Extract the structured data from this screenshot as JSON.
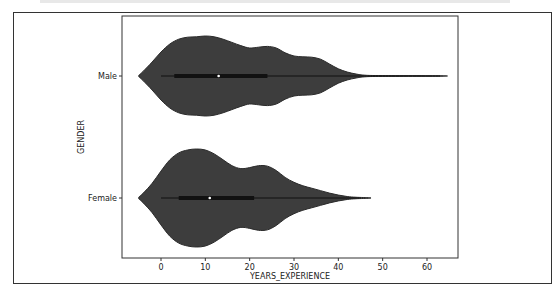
{
  "chart_data": {
    "type": "violin",
    "orientation": "horizontal",
    "title": "",
    "xlabel": "YEARS_EXPERIENCE",
    "ylabel": "GENDER",
    "xlim": [
      -6,
      70
    ],
    "xticks": [
      0,
      10,
      20,
      30,
      40,
      50,
      60
    ],
    "categories": [
      "Male",
      "Female"
    ],
    "fill_color": "#3d3d3d",
    "edge_color": "#2a2a2a",
    "series": [
      {
        "name": "Male",
        "min": 0,
        "q1": 3,
        "median": 13,
        "q3": 24,
        "max": 63,
        "density": [
          [
            -5,
            0.02
          ],
          [
            -4,
            0.12
          ],
          [
            -2,
            0.35
          ],
          [
            0,
            0.6
          ],
          [
            2,
            0.8
          ],
          [
            4,
            0.92
          ],
          [
            6,
            0.97
          ],
          [
            8,
            0.98
          ],
          [
            10,
            1.0
          ],
          [
            12,
            0.98
          ],
          [
            14,
            0.92
          ],
          [
            16,
            0.84
          ],
          [
            18,
            0.76
          ],
          [
            20,
            0.7
          ],
          [
            22,
            0.72
          ],
          [
            24,
            0.74
          ],
          [
            26,
            0.7
          ],
          [
            28,
            0.58
          ],
          [
            30,
            0.5
          ],
          [
            32,
            0.48
          ],
          [
            34,
            0.47
          ],
          [
            36,
            0.42
          ],
          [
            38,
            0.3
          ],
          [
            40,
            0.18
          ],
          [
            42,
            0.1
          ],
          [
            44,
            0.05
          ],
          [
            46,
            0.02
          ],
          [
            50,
            0.01
          ],
          [
            63,
            0.005
          ]
        ]
      },
      {
        "name": "Female",
        "min": 0,
        "q1": 4,
        "median": 11,
        "q3": 21,
        "max": 45,
        "density": [
          [
            -5,
            0.02
          ],
          [
            -4,
            0.1
          ],
          [
            -2,
            0.3
          ],
          [
            0,
            0.55
          ],
          [
            2,
            0.78
          ],
          [
            4,
            0.92
          ],
          [
            6,
            0.98
          ],
          [
            8,
            1.0
          ],
          [
            10,
            0.98
          ],
          [
            12,
            0.9
          ],
          [
            14,
            0.78
          ],
          [
            16,
            0.66
          ],
          [
            18,
            0.6
          ],
          [
            20,
            0.62
          ],
          [
            22,
            0.66
          ],
          [
            24,
            0.65
          ],
          [
            26,
            0.56
          ],
          [
            28,
            0.42
          ],
          [
            30,
            0.32
          ],
          [
            32,
            0.25
          ],
          [
            34,
            0.2
          ],
          [
            36,
            0.15
          ],
          [
            38,
            0.1
          ],
          [
            40,
            0.06
          ],
          [
            42,
            0.03
          ],
          [
            44,
            0.015
          ],
          [
            47,
            0.005
          ]
        ]
      }
    ]
  }
}
